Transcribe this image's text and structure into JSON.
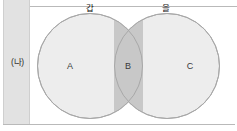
{
  "diagram": {
    "type": "venn-two-set",
    "left_column": {
      "label": "(나)"
    },
    "sets": [
      {
        "id": "gap",
        "label": "갑",
        "position": "left"
      },
      {
        "id": "eul",
        "label": "을",
        "position": "right"
      }
    ],
    "regions": [
      {
        "id": "A",
        "label": "A",
        "meaning": "gap-only",
        "fill": "#ededed"
      },
      {
        "id": "B",
        "label": "B",
        "meaning": "gap-and-eul-intersection",
        "fill": "#c8c8c8"
      },
      {
        "id": "C",
        "label": "C",
        "meaning": "eul-only",
        "fill": "#ededed"
      }
    ],
    "colors": {
      "circle_fill": "#ededed",
      "intersection_fill": "#c8c8c8",
      "circle_stroke": "#a8a8a8",
      "column_fill": "#e2e2e2",
      "rule": "#b9b9b9",
      "background": "#ffffff"
    }
  }
}
